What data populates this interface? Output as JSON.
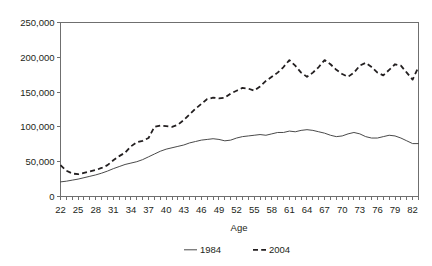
{
  "chart_data": {
    "type": "line",
    "title": "",
    "subtitle": "",
    "xlabel": "Age",
    "ylabel": "",
    "xlim": [
      22,
      83
    ],
    "ylim": [
      0,
      250000
    ],
    "grid": false,
    "legend_position": "bottom",
    "y_ticks": [
      0,
      50000,
      100000,
      150000,
      200000,
      250000
    ],
    "y_tick_labels": [
      "0",
      "50,000",
      "100,000",
      "150,000",
      "200,000",
      "250,000"
    ],
    "x_ticks": [
      22,
      25,
      28,
      31,
      34,
      37,
      40,
      43,
      46,
      49,
      52,
      55,
      58,
      61,
      64,
      67,
      70,
      73,
      76,
      79,
      82
    ],
    "x_tick_labels": [
      "22",
      "25",
      "28",
      "31",
      "34",
      "37",
      "40",
      "43",
      "46",
      "49",
      "52",
      "55",
      "58",
      "61",
      "64",
      "67",
      "70",
      "73",
      "76",
      "79",
      "82"
    ],
    "x": [
      22,
      23,
      24,
      25,
      26,
      27,
      28,
      29,
      30,
      31,
      32,
      33,
      34,
      35,
      36,
      37,
      38,
      39,
      40,
      41,
      42,
      43,
      44,
      45,
      46,
      47,
      48,
      49,
      50,
      51,
      52,
      53,
      54,
      55,
      56,
      57,
      58,
      59,
      60,
      61,
      62,
      63,
      64,
      65,
      66,
      67,
      68,
      69,
      70,
      71,
      72,
      73,
      74,
      75,
      76,
      77,
      78,
      79,
      80,
      81,
      82,
      83
    ],
    "series": [
      {
        "name": "1984",
        "style": "solid",
        "color": "#4a4a4a",
        "values": [
          21000,
          22000,
          23500,
          25000,
          27000,
          29000,
          31000,
          33500,
          36500,
          40000,
          43000,
          46000,
          48000,
          50000,
          53000,
          57000,
          61000,
          65000,
          68000,
          70000,
          72000,
          74000,
          77000,
          79000,
          81000,
          82000,
          83000,
          82000,
          80000,
          81000,
          84000,
          86000,
          87000,
          88000,
          89000,
          88000,
          90000,
          92000,
          92000,
          94000,
          93000,
          95000,
          96000,
          95000,
          93000,
          91000,
          88000,
          86000,
          87000,
          90000,
          92000,
          90000,
          86000,
          84000,
          84000,
          86000,
          88000,
          87000,
          84000,
          80000,
          76000,
          76000
        ]
      },
      {
        "name": "2004",
        "style": "dashed",
        "color": "#231f20",
        "values": [
          45000,
          37000,
          33000,
          32000,
          34000,
          36000,
          38000,
          41000,
          45000,
          52000,
          58000,
          63000,
          72000,
          78000,
          80000,
          84000,
          100000,
          102000,
          101000,
          100000,
          103000,
          110000,
          118000,
          126000,
          133000,
          140000,
          142000,
          141000,
          142000,
          148000,
          152000,
          156000,
          155000,
          152000,
          158000,
          166000,
          172000,
          178000,
          186000,
          196000,
          188000,
          178000,
          172000,
          178000,
          186000,
          196000,
          190000,
          182000,
          176000,
          172000,
          178000,
          188000,
          192000,
          186000,
          178000,
          174000,
          182000,
          190000,
          188000,
          178000,
          168000,
          186000
        ]
      }
    ]
  },
  "legend": {
    "items": [
      {
        "label": "1984",
        "style": "solid"
      },
      {
        "label": "2004",
        "style": "dashed"
      }
    ]
  }
}
